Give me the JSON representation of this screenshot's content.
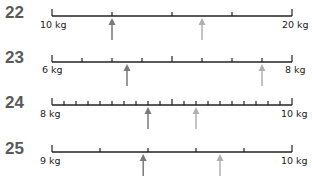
{
  "questions": [
    {
      "number": "22",
      "min_label": "10 kg",
      "max_label": "20 kg",
      "min": 10,
      "max": 20,
      "segments": 4,
      "major_every": 0,
      "arrows": [
        {
          "value": 12.5,
          "shade": "dark"
        },
        {
          "value": 16.25,
          "shade": "light"
        }
      ]
    },
    {
      "number": "23",
      "min_label": "6 kg",
      "max_label": "8 kg",
      "min": 6,
      "max": 8,
      "segments": 8,
      "major_every": 4,
      "arrows": [
        {
          "value": 6.625,
          "shade": "dark"
        },
        {
          "value": 7.75,
          "shade": "light"
        }
      ]
    },
    {
      "number": "24",
      "min_label": "8 kg",
      "max_label": "10 kg",
      "min": 8,
      "max": 10,
      "segments": 20,
      "major_every": 10,
      "arrows": [
        {
          "value": 8.8,
          "shade": "dark"
        },
        {
          "value": 9.2,
          "shade": "light"
        }
      ]
    },
    {
      "number": "25",
      "min_label": "9 kg",
      "max_label": "10 kg",
      "min": 9,
      "max": 10,
      "segments": 5,
      "major_every": 0,
      "arrows": [
        {
          "value": 9.38,
          "shade": "dark"
        },
        {
          "value": 9.7,
          "shade": "light"
        }
      ]
    }
  ],
  "colors": {
    "line": "#222222",
    "arrow_dark": "#7a7a7a",
    "arrow_light": "#b0b0b0",
    "number": "#5a5a5a"
  }
}
